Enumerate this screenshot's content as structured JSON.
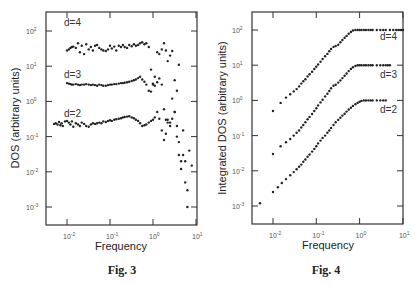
{
  "chart_data": [
    {
      "type": "scatter",
      "caption": "Fig. 3",
      "title": "",
      "xlabel": "Frequency",
      "ylabel": "DOS (arbitrary units)",
      "xscale": "log",
      "yscale": "log",
      "xlim": [
        0.004,
        10
      ],
      "ylim": [
        0.0003,
        300
      ],
      "xticks": [
        "10^-2",
        "10^-1",
        "10^0",
        "10^1"
      ],
      "yticks": [
        "10^-3",
        "10^-2",
        "10^-1",
        "10^0",
        "10^1",
        "10^2"
      ],
      "grid": false,
      "series": [
        {
          "name": "d=4",
          "x": [
            0.01,
            0.011,
            0.012,
            0.013,
            0.014,
            0.016,
            0.018,
            0.02,
            0.022,
            0.025,
            0.028,
            0.032,
            0.036,
            0.04,
            0.045,
            0.05,
            0.056,
            0.063,
            0.07,
            0.08,
            0.09,
            0.1,
            0.11,
            0.125,
            0.14,
            0.16,
            0.18,
            0.2,
            0.22,
            0.25,
            0.28,
            0.32,
            0.36,
            0.4,
            0.45,
            0.5,
            0.56,
            0.63,
            0.7,
            0.8,
            0.9,
            1.0,
            1.1,
            1.25,
            1.4,
            1.6,
            1.8,
            2.0,
            2.2,
            2.5,
            2.8,
            3.2,
            3.6,
            4.0
          ],
          "y": [
            28,
            30,
            33,
            35,
            36,
            33,
            45,
            25,
            38,
            22,
            42,
            30,
            35,
            28,
            38,
            40,
            33,
            30,
            28,
            27,
            30,
            38,
            32,
            36,
            28,
            38,
            35,
            40,
            35,
            33,
            40,
            37,
            42,
            38,
            40,
            45,
            48,
            42,
            45,
            35,
            8,
            3,
            5,
            25,
            22,
            30,
            45,
            28,
            14,
            20,
            27,
            4,
            2,
            11
          ]
        },
        {
          "name": "d=3",
          "x": [
            0.01,
            0.011,
            0.012,
            0.013,
            0.014,
            0.016,
            0.018,
            0.02,
            0.022,
            0.025,
            0.028,
            0.032,
            0.036,
            0.04,
            0.045,
            0.05,
            0.056,
            0.063,
            0.07,
            0.08,
            0.09,
            0.1,
            0.11,
            0.125,
            0.14,
            0.16,
            0.18,
            0.2,
            0.22,
            0.25,
            0.28,
            0.32,
            0.36,
            0.4,
            0.45,
            0.5,
            0.56,
            0.63,
            0.7,
            0.8,
            0.9,
            1.0,
            1.1,
            1.25,
            1.4,
            1.6,
            1.8,
            2.0,
            2.2,
            2.5,
            2.8,
            3.2,
            3.6,
            4.0,
            4.5,
            5.0,
            5.6,
            6.3
          ],
          "y": [
            3.3,
            3.2,
            3.1,
            3.0,
            3.0,
            3.1,
            3.0,
            2.9,
            3.0,
            3.0,
            3.1,
            3.0,
            2.9,
            3.0,
            2.9,
            2.8,
            3.0,
            2.9,
            2.8,
            2.8,
            2.9,
            3.0,
            3.0,
            3.1,
            3.1,
            3.2,
            3.3,
            3.3,
            3.4,
            3.5,
            3.6,
            3.8,
            4.0,
            4.2,
            4.6,
            5.0,
            4.2,
            3.6,
            3.0,
            2.0,
            1.9,
            3.2,
            2.8,
            3.5,
            4.5,
            3.0,
            0.6,
            0.3,
            0.3,
            0.25,
            1.2,
            0.5,
            0.2,
            0.07,
            0.02,
            0.03,
            0.005,
            0.001
          ]
        },
        {
          "name": "d=2",
          "x": [
            0.005,
            0.0055,
            0.006,
            0.0065,
            0.007,
            0.0075,
            0.008,
            0.009,
            0.01,
            0.011,
            0.012,
            0.013,
            0.014,
            0.016,
            0.018,
            0.02,
            0.022,
            0.025,
            0.028,
            0.032,
            0.036,
            0.04,
            0.045,
            0.05,
            0.056,
            0.063,
            0.07,
            0.08,
            0.09,
            0.1,
            0.11,
            0.125,
            0.14,
            0.16,
            0.18,
            0.2,
            0.22,
            0.25,
            0.28,
            0.32,
            0.36,
            0.4,
            0.45,
            0.5,
            0.56,
            0.63,
            0.7,
            0.8,
            0.9,
            1.0,
            1.1,
            1.25,
            1.4,
            1.6,
            1.8,
            2.0,
            2.2,
            2.5,
            2.8,
            3.2,
            3.6,
            4.0,
            4.5,
            5.0,
            5.6,
            6.3,
            7.0,
            8.0
          ],
          "y": [
            0.23,
            0.24,
            0.22,
            0.26,
            0.21,
            0.24,
            0.2,
            0.27,
            0.28,
            0.25,
            0.22,
            0.27,
            0.19,
            0.24,
            0.22,
            0.2,
            0.25,
            0.23,
            0.2,
            0.19,
            0.22,
            0.24,
            0.23,
            0.24,
            0.25,
            0.24,
            0.27,
            0.26,
            0.28,
            0.29,
            0.28,
            0.3,
            0.31,
            0.32,
            0.33,
            0.35,
            0.36,
            0.37,
            0.38,
            0.35,
            0.33,
            0.3,
            0.28,
            0.24,
            0.2,
            0.21,
            0.22,
            0.25,
            0.28,
            0.3,
            0.35,
            0.5,
            0.32,
            0.15,
            0.08,
            0.12,
            0.25,
            0.2,
            0.32,
            0.5,
            0.1,
            0.03,
            0.012,
            0.15,
            0.02,
            0.003,
            0.04,
            0.015
          ]
        }
      ],
      "annotations": [
        "d=4",
        "d=3",
        "d=2"
      ]
    },
    {
      "type": "scatter",
      "caption": "Fig. 4",
      "title": "",
      "xlabel": "Frequency",
      "ylabel": "Integrated DOS (arbitrary units)",
      "xscale": "log",
      "yscale": "log",
      "xlim": [
        0.004,
        10
      ],
      "ylim": [
        0.0005,
        300
      ],
      "xticks": [
        "10^-2",
        "10^-1",
        "10^0",
        "10^1"
      ],
      "yticks": [
        "10^-3",
        "10^-2",
        "10^-1",
        "10^0",
        "10^1",
        "10^2"
      ],
      "grid": false,
      "series": [
        {
          "name": "d=4",
          "x": [
            0.01,
            0.015,
            0.02,
            0.025,
            0.03,
            0.035,
            0.04,
            0.045,
            0.05,
            0.056,
            0.063,
            0.07,
            0.08,
            0.09,
            0.1,
            0.11,
            0.125,
            0.14,
            0.16,
            0.18,
            0.2,
            0.22,
            0.25,
            0.28,
            0.32,
            0.36,
            0.4,
            0.45,
            0.5,
            0.56,
            0.63,
            0.7,
            0.8,
            0.9,
            1.0,
            1.1,
            1.25,
            1.4,
            1.6,
            1.8,
            2.0,
            2.5,
            3.0,
            3.5,
            4.0,
            5.0,
            6.0,
            7.0,
            8.0,
            9.0,
            10.0
          ],
          "y": [
            0.5,
            0.85,
            1.2,
            1.5,
            1.8,
            2.1,
            2.5,
            3.0,
            3.5,
            4.0,
            4.8,
            5.5,
            6.5,
            7.8,
            9.0,
            10.5,
            12.5,
            15,
            18,
            21,
            25,
            29,
            33,
            35,
            38,
            45,
            52,
            60,
            68,
            78,
            88,
            97,
            100,
            100,
            100,
            100,
            100,
            100,
            100,
            100,
            100,
            100,
            100,
            100,
            100,
            100,
            100,
            100,
            100,
            100,
            100
          ]
        },
        {
          "name": "d=3",
          "x": [
            0.01,
            0.015,
            0.02,
            0.025,
            0.03,
            0.035,
            0.04,
            0.045,
            0.05,
            0.056,
            0.063,
            0.07,
            0.08,
            0.09,
            0.1,
            0.11,
            0.125,
            0.14,
            0.16,
            0.18,
            0.2,
            0.22,
            0.25,
            0.28,
            0.32,
            0.36,
            0.4,
            0.45,
            0.5,
            0.56,
            0.63,
            0.7,
            0.8,
            0.9,
            1.0,
            1.1,
            1.25,
            1.4,
            1.6,
            1.8,
            2.0,
            2.5,
            3.0,
            3.5,
            4.0,
            4.5,
            5.0
          ],
          "y": [
            0.03,
            0.05,
            0.065,
            0.08,
            0.1,
            0.12,
            0.14,
            0.17,
            0.2,
            0.24,
            0.29,
            0.34,
            0.41,
            0.5,
            0.6,
            0.72,
            0.88,
            1.05,
            1.3,
            1.55,
            1.85,
            2.2,
            2.6,
            2.8,
            3.2,
            3.7,
            4.3,
            5.0,
            5.8,
            6.8,
            7.8,
            8.8,
            9.5,
            10,
            10,
            10,
            10,
            10,
            10,
            10,
            10,
            10,
            10,
            10,
            10,
            10,
            10
          ]
        },
        {
          "name": "d=2",
          "x": [
            0.005,
            0.01,
            0.013,
            0.016,
            0.02,
            0.025,
            0.03,
            0.035,
            0.04,
            0.045,
            0.05,
            0.056,
            0.063,
            0.07,
            0.08,
            0.09,
            0.1,
            0.11,
            0.125,
            0.14,
            0.16,
            0.18,
            0.2,
            0.22,
            0.25,
            0.28,
            0.32,
            0.36,
            0.4,
            0.45,
            0.5,
            0.56,
            0.63,
            0.7,
            0.8,
            0.9,
            1.0,
            1.1,
            1.25,
            1.4,
            1.6,
            1.8,
            2.0,
            2.5,
            3.0,
            3.5,
            4.0
          ],
          "y": [
            0.0012,
            0.0025,
            0.0034,
            0.0045,
            0.0058,
            0.0075,
            0.0092,
            0.011,
            0.013,
            0.015,
            0.018,
            0.021,
            0.025,
            0.029,
            0.035,
            0.042,
            0.05,
            0.06,
            0.072,
            0.086,
            0.1,
            0.12,
            0.14,
            0.165,
            0.2,
            0.24,
            0.28,
            0.32,
            0.37,
            0.42,
            0.48,
            0.55,
            0.62,
            0.7,
            0.78,
            0.85,
            0.92,
            0.97,
            1.0,
            1.0,
            1.0,
            1.0,
            1.0,
            1.0,
            1.0,
            1.0,
            1.0
          ]
        }
      ],
      "annotations": [
        "d=4",
        "d=3",
        "d=2"
      ]
    }
  ],
  "figures": {
    "fig3": {
      "caption": "Fig. 3",
      "xlabel": "Frequency",
      "ylabel": "DOS (arbitrary units)",
      "labels": {
        "d4": "d=4",
        "d3": "d=3",
        "d2": "d=2"
      }
    },
    "fig4": {
      "caption": "Fig. 4",
      "xlabel": "Frequency",
      "ylabel": "Integrated DOS (arbitrary units)",
      "labels": {
        "d4": "d=4",
        "d3": "d=3",
        "d2": "d=2"
      }
    },
    "tick_base": "10",
    "xtick_exps": [
      "-2",
      "-1",
      "0",
      "1"
    ],
    "ytick_exps": [
      "2",
      "1",
      "0",
      "-1",
      "-2",
      "-3"
    ]
  }
}
